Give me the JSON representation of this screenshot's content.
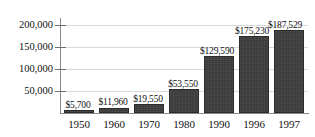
{
  "chart_data": {
    "type": "bar",
    "title": "",
    "subtitle": "",
    "xlabel": "",
    "ylabel": "",
    "categories": [
      "1950",
      "1960",
      "1970",
      "1980",
      "1990",
      "1996",
      "1997"
    ],
    "values": [
      5700,
      11960,
      19550,
      53550,
      129590,
      175230,
      187529
    ],
    "value_labels": [
      "$5,700",
      "$11,960",
      "$19,550",
      "$53,550",
      "$129,590",
      "$175,230",
      "$187,529"
    ],
    "ytick_labels": [
      "200,000",
      "150,000",
      "100,000",
      "50,000"
    ],
    "ytick_values": [
      200000,
      150000,
      100000,
      50000
    ],
    "ylim": [
      0,
      210000
    ],
    "grid": true,
    "legend": null,
    "legend_position": "none",
    "bar_color": "#3b3b3b",
    "grid_color": "#d8d8d8",
    "axis_color": "#8a8a8a",
    "text_color": "#111111",
    "background_color": "#ffffff"
  }
}
